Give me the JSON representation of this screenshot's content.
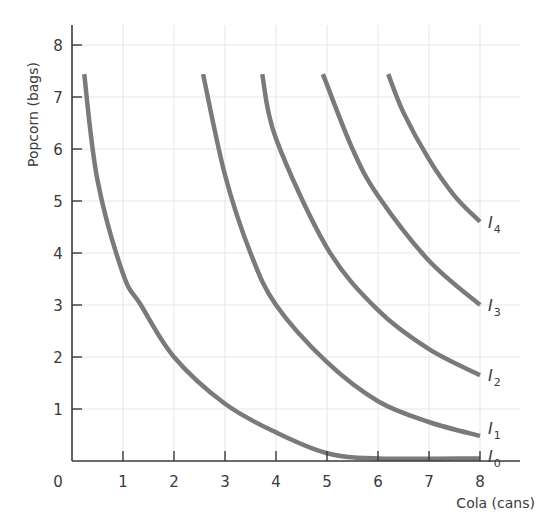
{
  "chart_data": {
    "type": "line",
    "title": "",
    "xlabel": "Cola (cans)",
    "ylabel": "Popcorn (bags)",
    "xlim": [
      0,
      8
    ],
    "ylim": [
      0,
      8
    ],
    "grid": true,
    "x_ticks": [
      "0",
      "1",
      "2",
      "3",
      "4",
      "5",
      "6",
      "7",
      "8"
    ],
    "y_ticks": [
      "1",
      "2",
      "3",
      "4",
      "5",
      "6",
      "7",
      "8"
    ],
    "origin_label": "0",
    "legend": "inline labels at right end of each curve",
    "series": [
      {
        "name": "I0",
        "label_main": "I",
        "label_sub": "0",
        "points": [
          [
            0.24,
            7.44
          ],
          [
            0.5,
            5.4
          ],
          [
            1,
            3.6
          ],
          [
            1.35,
            3.0
          ],
          [
            2,
            2.0
          ],
          [
            3,
            1.1
          ],
          [
            4,
            0.55
          ],
          [
            5,
            0.15
          ],
          [
            6,
            0.05
          ],
          [
            8,
            0.05
          ]
        ]
      },
      {
        "name": "I1",
        "label_main": "I",
        "label_sub": "1",
        "points": [
          [
            2.57,
            7.44
          ],
          [
            3,
            5.5
          ],
          [
            3.5,
            4.0
          ],
          [
            4,
            3.0
          ],
          [
            5,
            1.9
          ],
          [
            6,
            1.15
          ],
          [
            7,
            0.75
          ],
          [
            8,
            0.48
          ]
        ]
      },
      {
        "name": "I2",
        "label_main": "I",
        "label_sub": "2",
        "points": [
          [
            3.73,
            7.44
          ],
          [
            4,
            6.2
          ],
          [
            5,
            4.1
          ],
          [
            6,
            2.9
          ],
          [
            7,
            2.15
          ],
          [
            8,
            1.65
          ]
        ]
      },
      {
        "name": "I3",
        "label_main": "I",
        "label_sub": "3",
        "points": [
          [
            4.92,
            7.44
          ],
          [
            5.5,
            6.0
          ],
          [
            6,
            5.1
          ],
          [
            7,
            3.85
          ],
          [
            8,
            3.0
          ]
        ]
      },
      {
        "name": "I4",
        "label_main": "I",
        "label_sub": "4",
        "points": [
          [
            6.2,
            7.44
          ],
          [
            6.5,
            6.7
          ],
          [
            7,
            5.8
          ],
          [
            7.5,
            5.1
          ],
          [
            8,
            4.6
          ]
        ]
      }
    ],
    "colors": {
      "curve": "#7a7a7a",
      "axis": "#3a3a3a",
      "grid": "#e6e6e6"
    }
  }
}
